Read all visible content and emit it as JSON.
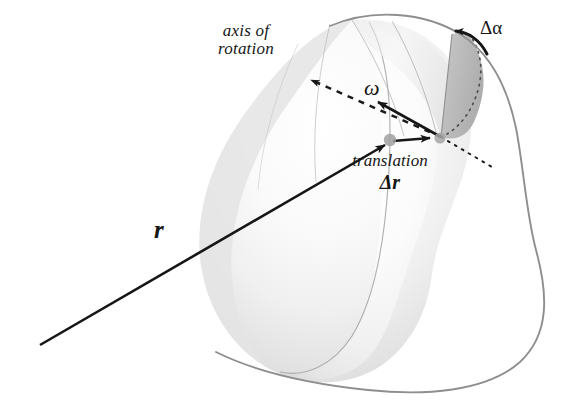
{
  "figure": {
    "background_color": "#ffffff",
    "width": 576,
    "height": 411
  },
  "labels": {
    "axis_line1": "axis of",
    "axis_line2": "rotation",
    "omega": "ω",
    "translation_word": "translation",
    "translation_delta": "Δr",
    "delta_alpha": "Δα",
    "position_vector": "r"
  },
  "colors": {
    "ink": "#161616",
    "body_fill_light": "#f3f3f3",
    "body_fill_mid": "#dcdcdc",
    "body_fill_dark": "#c9c9c9",
    "wedge_fill": "#b8b8b8",
    "outline_gray": "#8e8e8e",
    "meridian_gray": "#9a9a9a",
    "dot_gray": "#9c9c9c"
  },
  "geometry": {
    "pivot_point": [
      440,
      138
    ],
    "r_tail": [
      40,
      345
    ],
    "r_head": [
      392,
      140
    ],
    "omega_head": [
      371,
      99
    ],
    "omega_tail": [
      441,
      137
    ],
    "axis_arrow_head": [
      305,
      77
    ],
    "axis_arrow_tail": [
      441,
      137
    ],
    "delta_r_arrow_tail": [
      392,
      142
    ],
    "delta_r_arrow_head": [
      437,
      138
    ]
  },
  "icon_names": {
    "axis_arrow": "dashed-arrow-icon",
    "omega_arrow": "solid-arrow-icon",
    "r_arrow": "vector-arrow-icon",
    "translation_arrow": "translation-arrow-icon",
    "rotation_arc": "curved-arrow-icon",
    "pivot_dot": "pivot-dot-icon",
    "contact_dot": "contact-dot-icon"
  }
}
